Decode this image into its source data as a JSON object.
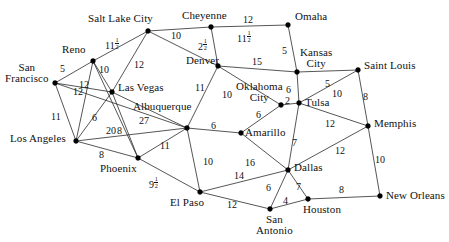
{
  "diagram": {
    "type": "weighted-undirected-graph",
    "node_count": 21,
    "edge_count": 36,
    "nodes": [
      {
        "id": "san_francisco",
        "label": "San\nFrancisco",
        "label_lines": [
          "San",
          "Francisco"
        ],
        "x": 55,
        "y": 83
      },
      {
        "id": "reno",
        "label": "Reno",
        "x": 93,
        "y": 61
      },
      {
        "id": "salt_lake_city",
        "label": "Salt Lake City",
        "x": 148,
        "y": 31
      },
      {
        "id": "cheyenne",
        "label": "Cheyenne",
        "x": 211,
        "y": 27
      },
      {
        "id": "omaha",
        "label": "Omaha",
        "x": 288,
        "y": 25
      },
      {
        "id": "kansas_city",
        "label": "Kansas\nCity",
        "label_lines": [
          "Kansas",
          "City"
        ],
        "x": 297,
        "y": 72
      },
      {
        "id": "saint_louis",
        "label": "Saint Louis",
        "x": 358,
        "y": 70
      },
      {
        "id": "denver",
        "label": "Denver",
        "x": 218,
        "y": 66
      },
      {
        "id": "las_vegas",
        "label": "Las Vegas",
        "x": 112,
        "y": 92
      },
      {
        "id": "albuquerque",
        "label": "Albuquerque",
        "x": 187,
        "y": 128
      },
      {
        "id": "oklahoma_city",
        "label": "Oklahoma\nCity",
        "label_lines": [
          "Oklahoma",
          "City"
        ],
        "x": 281,
        "y": 105
      },
      {
        "id": "tulsa",
        "label": "Tulsa",
        "x": 299,
        "y": 103
      },
      {
        "id": "memphis",
        "label": "Memphis",
        "x": 368,
        "y": 126
      },
      {
        "id": "los_angeles",
        "label": "Los Angeles",
        "x": 76,
        "y": 141
      },
      {
        "id": "amarillo",
        "label": "Amarillo",
        "x": 241,
        "y": 133
      },
      {
        "id": "phoenix",
        "label": "Phoenix",
        "x": 138,
        "y": 158
      },
      {
        "id": "dallas",
        "label": "Dallas",
        "x": 288,
        "y": 170
      },
      {
        "id": "el_paso",
        "label": "El Paso",
        "x": 200,
        "y": 192
      },
      {
        "id": "san_antonio",
        "label": "San\nAntonio",
        "label_lines": [
          "San",
          "Antonio"
        ],
        "x": 270,
        "y": 209
      },
      {
        "id": "houston",
        "label": "Houston",
        "x": 308,
        "y": 199
      },
      {
        "id": "new_orleans",
        "label": "New Orleans",
        "x": 380,
        "y": 196
      }
    ],
    "edges": [
      {
        "from": "san_francisco",
        "to": "reno",
        "weight": "5",
        "lx": 65,
        "ly": 69
      },
      {
        "from": "san_francisco",
        "to": "las_vegas",
        "weight": "12",
        "lx": 78,
        "ly": 92
      },
      {
        "from": "san_francisco",
        "to": "los_angeles",
        "weight": "11",
        "lx": 56,
        "ly": 117
      },
      {
        "from": "san_francisco",
        "to": "albuquerque",
        "weight": "",
        "lx": 0,
        "ly": 0
      },
      {
        "from": "reno",
        "to": "salt_lake_city",
        "weight": "11",
        "fraction": "1/2",
        "lx": 110,
        "ly": 43
      },
      {
        "from": "reno",
        "to": "las_vegas",
        "weight": "10",
        "lx": 104,
        "ly": 70
      },
      {
        "from": "reno",
        "to": "los_angeles",
        "weight": "12",
        "lx": 84,
        "ly": 85
      },
      {
        "from": "reno",
        "to": "phoenix",
        "weight": "",
        "lx": 0,
        "ly": 0
      },
      {
        "from": "salt_lake_city",
        "to": "cheyenne",
        "weight": "10",
        "lx": 176,
        "ly": 36
      },
      {
        "from": "salt_lake_city",
        "to": "las_vegas",
        "weight": "12",
        "lx": 139,
        "ly": 65
      },
      {
        "from": "cheyenne",
        "to": "omaha",
        "weight": "12",
        "lx": 248,
        "ly": 20
      },
      {
        "from": "cheyenne",
        "to": "denver",
        "weight": "2",
        "fraction": "1/2",
        "lx": 203,
        "ly": 44
      },
      {
        "from": "denver",
        "to": "salt_lake_city",
        "weight": "11",
        "fraction": "1/2",
        "lx": 242,
        "ly": 36
      },
      {
        "from": "denver",
        "to": "kansas_city",
        "weight": "15",
        "lx": 257,
        "ly": 62
      },
      {
        "from": "denver",
        "to": "albuquerque",
        "weight": "11",
        "lx": 200,
        "ly": 88
      },
      {
        "from": "denver",
        "to": "oklahoma_city",
        "weight": "10",
        "lx": 227,
        "ly": 95
      },
      {
        "from": "omaha",
        "to": "kansas_city",
        "weight": "5",
        "lx": 287,
        "ly": 51
      },
      {
        "from": "kansas_city",
        "to": "saint_louis",
        "weight": "5",
        "lx": 330,
        "ly": 84
      },
      {
        "from": "kansas_city",
        "to": "tulsa",
        "weight": "6",
        "lx": 291,
        "ly": 90
      },
      {
        "from": "saint_louis",
        "to": "tulsa",
        "weight": "10",
        "lx": 337,
        "ly": 94
      },
      {
        "from": "saint_louis",
        "to": "memphis",
        "weight": "8",
        "lx": 368,
        "ly": 97
      },
      {
        "from": "oklahoma_city",
        "to": "tulsa",
        "weight": "2",
        "lx": 290,
        "ly": 101
      },
      {
        "from": "oklahoma_city",
        "to": "amarillo",
        "weight": "6",
        "lx": 261,
        "ly": 115
      },
      {
        "from": "tulsa",
        "to": "memphis",
        "weight": "12",
        "lx": 330,
        "ly": 124
      },
      {
        "from": "tulsa",
        "to": "dallas",
        "weight": "7",
        "lx": 297,
        "ly": 143
      },
      {
        "from": "memphis",
        "to": "dallas",
        "weight": "12",
        "lx": 340,
        "ly": 151
      },
      {
        "from": "memphis",
        "to": "new_orleans",
        "weight": "10",
        "lx": 380,
        "ly": 160
      },
      {
        "from": "las_vegas",
        "to": "los_angeles",
        "weight": "6",
        "lx": 97,
        "ly": 118
      },
      {
        "from": "las_vegas",
        "to": "albuquerque",
        "weight": "27",
        "lx": 144,
        "ly": 121
      },
      {
        "from": "las_vegas",
        "to": "phoenix",
        "weight": "8",
        "lx": 122,
        "ly": 131
      },
      {
        "from": "los_angeles",
        "to": "albuquerque",
        "weight": "20",
        "lx": 111,
        "ly": 131
      },
      {
        "from": "los_angeles",
        "to": "phoenix",
        "weight": "8",
        "lx": 104,
        "ly": 155
      },
      {
        "from": "albuquerque",
        "to": "amarillo",
        "weight": "6",
        "lx": 216,
        "ly": 126
      },
      {
        "from": "albuquerque",
        "to": "phoenix",
        "weight": "11",
        "lx": 165,
        "ly": 146
      },
      {
        "from": "albuquerque",
        "to": "el_paso",
        "weight": "10",
        "lx": 208,
        "ly": 162
      },
      {
        "from": "amarillo",
        "to": "dallas",
        "weight": "16",
        "lx": 250,
        "ly": 163
      },
      {
        "from": "phoenix",
        "to": "el_paso",
        "weight": "9",
        "fraction": "1/2",
        "lx": 154,
        "ly": 182
      },
      {
        "from": "el_paso",
        "to": "dallas",
        "weight": "14",
        "lx": 239,
        "ly": 176
      },
      {
        "from": "el_paso",
        "to": "san_antonio",
        "weight": "12",
        "lx": 232,
        "ly": 205
      },
      {
        "from": "dallas",
        "to": "san_antonio",
        "weight": "6",
        "lx": 271,
        "ly": 188
      },
      {
        "from": "dallas",
        "to": "houston",
        "weight": "7",
        "lx": 301,
        "ly": 187
      },
      {
        "from": "san_antonio",
        "to": "houston",
        "weight": "4",
        "lx": 288,
        "ly": 201
      },
      {
        "from": "houston",
        "to": "new_orleans",
        "weight": "8",
        "lx": 344,
        "ly": 190
      }
    ],
    "weights_list": [
      "5",
      "12",
      "11",
      "11 1/2",
      "10",
      "12",
      "10",
      "12",
      "12",
      "2 1/2",
      "11 1/2",
      "15",
      "11",
      "10",
      "5",
      "5",
      "6",
      "10",
      "8",
      "2",
      "6",
      "12",
      "7",
      "12",
      "10",
      "6",
      "27",
      "8",
      "20",
      "8",
      "6",
      "11",
      "10",
      "16",
      "9 1/2",
      "14",
      "12",
      "6",
      "7",
      "4",
      "8"
    ],
    "colors": {
      "line": "#2b2b2b",
      "node": "#000000",
      "text": "#111111",
      "background": "#ffffff"
    }
  }
}
